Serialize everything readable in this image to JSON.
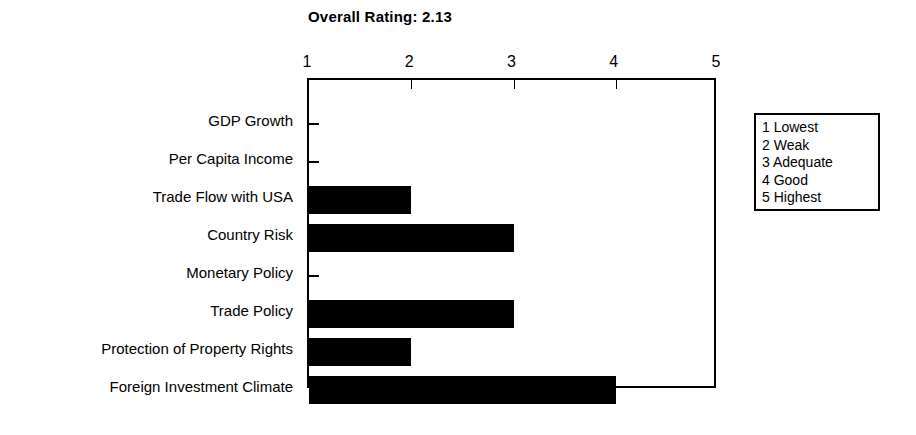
{
  "chart_data": {
    "type": "bar",
    "orientation": "horizontal",
    "title": "Overall Rating: 2.13",
    "xlabel": "",
    "ylabel": "",
    "xlim": [
      1,
      5
    ],
    "xticks": [
      "1",
      "2",
      "3",
      "4",
      "5"
    ],
    "grid": false,
    "legend_position": "right-outside",
    "categories": [
      "GDP Growth",
      "Per Capita Income",
      "Trade Flow with USA",
      "Country Risk",
      "Monetary Policy",
      "Trade Policy",
      "Protection of Property Rights",
      "Foreign Investment Climate"
    ],
    "values": [
      1,
      1,
      2,
      3,
      1,
      3,
      2,
      4
    ],
    "bar_color": "#000000",
    "legend_entries": [
      "1 Lowest",
      "2 Weak",
      "3 Adequate",
      "4 Good",
      "5 Highest"
    ]
  }
}
